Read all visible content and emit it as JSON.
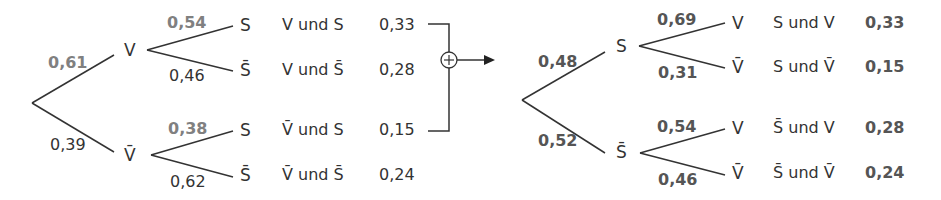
{
  "left_tree": {
    "first_level": [
      {
        "event": "V",
        "prob": "0,61"
      },
      {
        "event": "V̄",
        "prob": "0,39"
      }
    ],
    "second_level": [
      {
        "parent": "V",
        "event": "S",
        "prob": "0,54",
        "path": "V und S",
        "path_prob": "0,33"
      },
      {
        "parent": "V",
        "event": "S̄",
        "prob": "0,46",
        "path": "V und S̄",
        "path_prob": "0,28"
      },
      {
        "parent": "V̄",
        "event": "S",
        "prob": "0,38",
        "path": "V̄ und S",
        "path_prob": "0,15"
      },
      {
        "parent": "V̄",
        "event": "S̄",
        "prob": "0,62",
        "path": "V̄ und S̄",
        "path_prob": "0,24"
      }
    ]
  },
  "operator": {
    "symbol": "+",
    "icon": "circled-plus-icon"
  },
  "right_tree": {
    "first_level": [
      {
        "event": "S",
        "prob": "0,48"
      },
      {
        "event": "S̄",
        "prob": "0,52"
      }
    ],
    "second_level": [
      {
        "parent": "S",
        "event": "V",
        "prob": "0,69",
        "path": "S und V",
        "path_prob": "0,33"
      },
      {
        "parent": "S",
        "event": "V̄",
        "prob": "0,31",
        "path": "S und V̄",
        "path_prob": "0,15"
      },
      {
        "parent": "S̄",
        "event": "V",
        "prob": "0,54",
        "path": "S̄ und V",
        "path_prob": "0,28"
      },
      {
        "parent": "S̄",
        "event": "V̄",
        "prob": "0,46",
        "path": "S̄ und V̄",
        "path_prob": "0,24"
      }
    ]
  },
  "colors": {
    "line": "#333333",
    "highlight_prob": "#808080",
    "bold_prob": "#555555"
  }
}
